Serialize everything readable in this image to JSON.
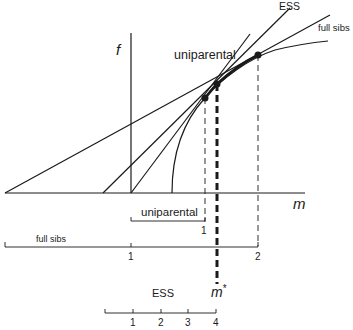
{
  "axes": {
    "y_label": "f",
    "x_label": "m"
  },
  "curve_labels": {
    "uniparental": "uniparental",
    "ess": "ESS",
    "full_sibs": "full sibs"
  },
  "optimum_label": "m*",
  "scales": {
    "uniparental": {
      "label": "uniparental",
      "ticks": [
        "1"
      ]
    },
    "full_sibs": {
      "label": "full sibs",
      "ticks": [
        "1",
        "2"
      ]
    },
    "ess": {
      "label": "ESS",
      "ticks": [
        "1",
        "2",
        "3",
        "4"
      ]
    }
  },
  "colors": {
    "ink": "#1a1a1a",
    "background": "#ffffff"
  }
}
